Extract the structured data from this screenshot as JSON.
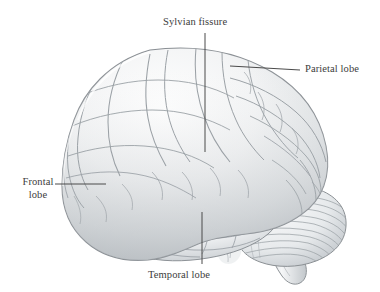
{
  "figure": {
    "background_color": "#ffffff",
    "label_color": "#3c3c3c",
    "line_color": "#4a4a4a",
    "outline_color": "#8f9295",
    "sulci_color": "#9aa0a4",
    "fill_light": "#fbfbfb",
    "fill_mid": "#e6e8ea",
    "fill_shadow": "#c8cccf"
  },
  "labels": {
    "sylvian_fissure": "Sylvian fissure",
    "parietal_lobe": "Parietal lobe",
    "frontal_lobe": "Frontal\nlobe",
    "temporal_lobe": "Temporal lobe"
  },
  "structures": [
    {
      "name": "cerebrum",
      "label": "Cerebrum"
    },
    {
      "name": "cerebellum",
      "label": "Cerebellum"
    },
    {
      "name": "brainstem",
      "label": "Brainstem"
    }
  ],
  "leader_lines": [
    {
      "name": "sylvian-fissure-leader",
      "orientation": "vertical",
      "x1": 205,
      "y1": 33,
      "x2": 205,
      "y2": 152
    },
    {
      "name": "parietal-lobe-leader",
      "orientation": "horizontal",
      "x1": 230,
      "y1": 66,
      "x2": 300,
      "y2": 70
    },
    {
      "name": "frontal-lobe-leader",
      "orientation": "horizontal",
      "x1": 55,
      "y1": 184,
      "x2": 106,
      "y2": 184
    },
    {
      "name": "temporal-lobe-leader",
      "orientation": "vertical",
      "x1": 202,
      "y1": 212,
      "x2": 202,
      "y2": 264
    }
  ]
}
